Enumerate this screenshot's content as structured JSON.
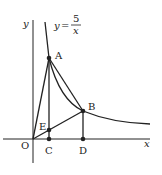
{
  "diagram": {
    "curve_label": {
      "lhs": "y",
      "eq": "=",
      "numerator": "5",
      "denominator": "x"
    },
    "axes": {
      "x": "x",
      "y": "y",
      "origin": "O"
    },
    "points": {
      "A": "A",
      "B": "B",
      "C": "C",
      "D": "D",
      "E": "E"
    },
    "colors": {
      "stroke": "#222222",
      "background": "#ffffff"
    }
  }
}
